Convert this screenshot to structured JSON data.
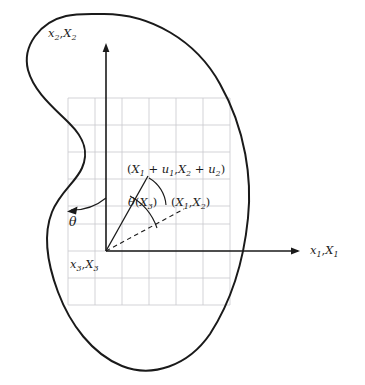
{
  "figure": {
    "type": "continuum-mechanics-deformation-diagram",
    "background_color": "#ffffff",
    "outline_color": "#1a1a1a",
    "grid_color": "#c8c8cd",
    "axis_color": "#1a1a1a",
    "label_color": "#1a1a1a"
  },
  "axes": {
    "origin": {
      "x": 106,
      "y": 251
    },
    "x_axis": {
      "label_x": "x",
      "label_x_sub": "1",
      "label_X": "X",
      "label_X_sub": "1",
      "label_full": "x1,X1",
      "arrow_tip_x": 300,
      "arrow_tip_y": 251
    },
    "y_axis": {
      "label_x": "x",
      "label_x_sub": "2",
      "label_X": "X",
      "label_X_sub": "2",
      "label_full": "x2,X2",
      "arrow_tip_x": 106,
      "arrow_tip_y": 43
    },
    "z_axis": {
      "label_x": "x",
      "label_x_sub": "3",
      "label_X": "X",
      "label_X_sub": "3",
      "label_full": "x3,X3",
      "note": "out-of-plane axis at origin"
    }
  },
  "grid": {
    "spacing": 27,
    "x_start": 68,
    "x_end": 230,
    "y_start": 98,
    "y_end": 305,
    "visible": true
  },
  "points": {
    "deformed": {
      "label_prefix": "(",
      "label_full": "(X1 + u1,X2 + u2)",
      "X": "X",
      "X1_sub": "1",
      "plus": " + ",
      "u": "u",
      "u1_sub": "1",
      "comma": ",",
      "X2_sub": "2",
      "u2_sub": "2",
      "close": ")",
      "x": 148,
      "y": 176
    },
    "reference": {
      "label_full": "(X1,X2)",
      "X": "X",
      "X1_sub": "1",
      "X2_sub": "2",
      "x": 182,
      "y": 205
    }
  },
  "angles": {
    "theta_of_X3": {
      "label_full": "θ(X3)",
      "theta": "θ",
      "open": "(",
      "X": "X",
      "sub": "3",
      "close": ")",
      "description": "rotation angle of material point, arc between dashed reference vector and solid deformed vector",
      "x": 134,
      "y": 203
    },
    "theta": {
      "label_full": "θ",
      "theta": "θ",
      "description": "rotation arc from vertical axis sweeping counter-clockwise to the left",
      "x": 72,
      "y": 222
    }
  },
  "vectors": {
    "deformed_vector": {
      "style": "solid",
      "from_x": 106,
      "from_y": 251,
      "to_x": 148,
      "to_y": 176
    },
    "reference_vector": {
      "style": "dashed",
      "from_x": 106,
      "from_y": 251,
      "to_x": 183,
      "to_y": 210
    }
  },
  "body": {
    "name": "deformable-body-outline",
    "shape": "kidney-blob",
    "stroke_width": 2
  }
}
